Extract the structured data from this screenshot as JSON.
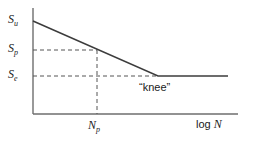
{
  "figure": {
    "type": "s-n-fatigue-curve",
    "background_color": "#ffffff",
    "line_color": "#3c3c3c",
    "axis_color": "#6e6e6e",
    "dash_color": "#555555"
  },
  "labels": {
    "y_ultimate": "S",
    "y_ultimate_sub": "u",
    "y_peak": "S",
    "y_peak_sub": "p",
    "y_endurance": "S",
    "y_endurance_sub": "e",
    "x_cycles": "N",
    "x_cycles_sub": "p",
    "x_axis_prefix": "log ",
    "x_axis_var": "N",
    "knee": "“knee”"
  },
  "chart_data": {
    "type": "line",
    "title": "",
    "xlabel": "log N",
    "ylabel": "",
    "grid": false,
    "legend": false,
    "axis_labels_y": [
      "S_u",
      "S_p",
      "S_e"
    ],
    "axis_labels_x": [
      "N_p",
      "log N"
    ],
    "annotations": [
      {
        "text": "“knee”",
        "x": 158,
        "y": 76
      }
    ],
    "series": [
      {
        "name": "S-N curve",
        "style": "solid",
        "points": [
          {
            "x": 33,
            "y": 21
          },
          {
            "x": 158,
            "y": 76
          },
          {
            "x": 228,
            "y": 76
          }
        ]
      }
    ],
    "guides": [
      {
        "name": "Sp-horizontal",
        "style": "dashed",
        "x1": 33,
        "y1": 50,
        "x2": 97,
        "y2": 50
      },
      {
        "name": "Se-horizontal",
        "style": "dashed",
        "x1": 33,
        "y1": 76,
        "x2": 158,
        "y2": 76
      },
      {
        "name": "Np-vertical",
        "style": "dashed",
        "x1": 97,
        "y1": 50,
        "x2": 97,
        "y2": 114
      }
    ],
    "axes": {
      "y_axis": {
        "x": 33,
        "y_top": 8,
        "y_bottom": 114
      },
      "x_axis": {
        "y": 114,
        "x_left": 33,
        "x_right": 238
      }
    }
  }
}
